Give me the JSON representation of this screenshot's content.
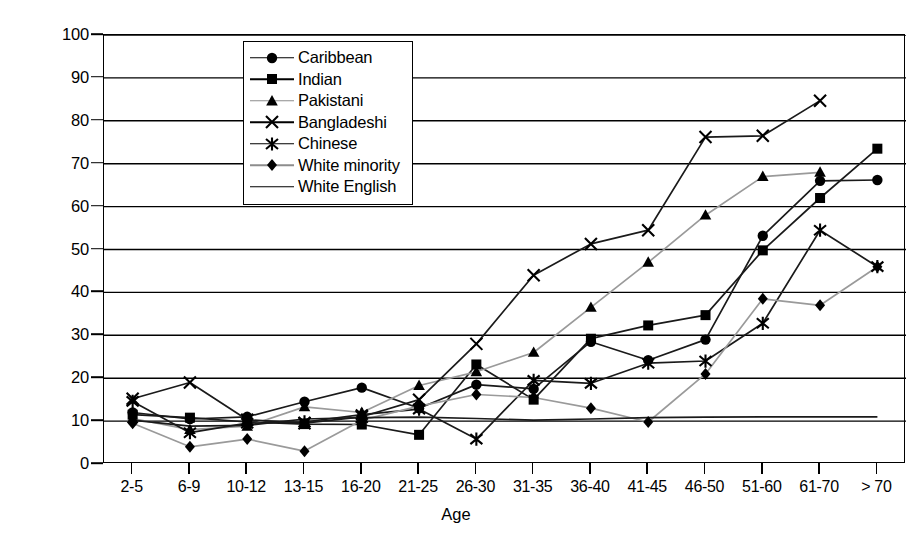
{
  "chart_data": {
    "type": "line",
    "title": "",
    "xlabel": "Age",
    "ylabel": "Absolute Percentage",
    "ylim": [
      0,
      100
    ],
    "ytick_step": 10,
    "yticks": [
      0,
      10,
      20,
      30,
      40,
      50,
      60,
      70,
      80,
      90,
      100
    ],
    "grid": true,
    "grid_axis": "y",
    "legend_position": "top-center-inside",
    "categories": [
      "2-5",
      "6-9",
      "10-12",
      "13-15",
      "16-20",
      "21-25",
      "26-30",
      "31-35",
      "36-40",
      "41-45",
      "46-50",
      "51-60",
      "61-70",
      "> 70"
    ],
    "series": [
      {
        "name": "Caribbean",
        "marker": "circle",
        "line_color": "#1a1a1a",
        "values": [
          12.0,
          10.5,
          11.0,
          14.5,
          17.8,
          13.0,
          18.5,
          17.5,
          28.5,
          24.2,
          29.0,
          53.2,
          66.0,
          66.2
        ]
      },
      {
        "name": "Indian",
        "marker": "square",
        "line_color": "#1a1a1a",
        "values": [
          11.5,
          10.8,
          9.8,
          9.3,
          9.2,
          6.8,
          23.2,
          15.0,
          29.2,
          32.3,
          34.7,
          49.8,
          62.0,
          73.5
        ]
      },
      {
        "name": "Pakistani",
        "marker": "triangle",
        "line_color": "#9a9a9a",
        "values": [
          10.6,
          8.0,
          8.8,
          13.3,
          12.0,
          18.3,
          21.5,
          26.0,
          36.5,
          47.0,
          58.0,
          67.0,
          68.0,
          null
        ]
      },
      {
        "name": "Bangladeshi",
        "marker": "cross",
        "line_color": "#1a1a1a",
        "values": [
          15.2,
          19.0,
          10.3,
          9.5,
          11.0,
          15.0,
          28.0,
          44.0,
          51.3,
          54.5,
          76.2,
          76.5,
          84.7,
          null
        ]
      },
      {
        "name": "Chinese",
        "marker": "star",
        "line_color": "#1a1a1a",
        "values": [
          14.6,
          7.3,
          9.5,
          9.8,
          11.5,
          12.8,
          5.8,
          19.5,
          18.8,
          23.5,
          24.0,
          32.8,
          54.5,
          46.0
        ]
      },
      {
        "name": "White minority",
        "marker": "diamond",
        "line_color": "#9a9a9a",
        "values": [
          9.5,
          4.0,
          5.8,
          3.0,
          10.2,
          13.5,
          16.2,
          15.5,
          13.0,
          9.8,
          21.0,
          38.5,
          37.0,
          46.0
        ]
      },
      {
        "name": "White English",
        "marker": "none",
        "line_color": "#1a1a1a",
        "values": [
          10.2,
          8.8,
          9.0,
          10.5,
          10.8,
          10.9,
          10.6,
          10.2,
          10.5,
          10.8,
          10.9,
          11.0,
          11.0,
          11.0
        ]
      }
    ]
  },
  "axis": {
    "y_title": "Absolute Percentage",
    "x_title": "Age"
  }
}
